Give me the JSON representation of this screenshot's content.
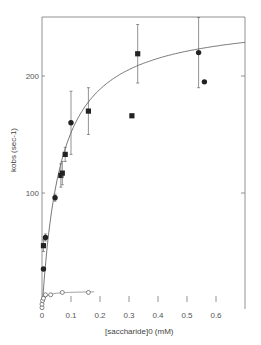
{
  "chart_data": {
    "type": "scatter",
    "title": "",
    "xlabel": "[saccharide]0 (mM)",
    "ylabel": "kobs (sec-1)",
    "xlim": [
      0,
      0.7
    ],
    "ylim": [
      0,
      250
    ],
    "x_ticks": [
      "0",
      "0.1",
      "0.2",
      "0.3",
      "0.4",
      "0.5",
      "0.6"
    ],
    "y_ticks": [
      "100",
      "200"
    ],
    "grid": false,
    "series": [
      {
        "name": "filled squares",
        "marker": "square-filled",
        "points": [
          {
            "x": 0.005,
            "y": 55,
            "err": 5
          },
          {
            "x": 0.065,
            "y": 115,
            "err": 10
          },
          {
            "x": 0.07,
            "y": 117,
            "err": 10
          },
          {
            "x": 0.08,
            "y": 133,
            "err": 6
          },
          {
            "x": 0.16,
            "y": 170,
            "err": 20
          },
          {
            "x": 0.31,
            "y": 166
          },
          {
            "x": 0.33,
            "y": 219,
            "err": 25
          }
        ]
      },
      {
        "name": "filled circles",
        "marker": "circle-filled",
        "points": [
          {
            "x": 0.005,
            "y": 35
          },
          {
            "x": 0.012,
            "y": 62,
            "err": 3
          },
          {
            "x": 0.045,
            "y": 96,
            "err": 3
          },
          {
            "x": 0.1,
            "y": 160,
            "err": 27
          },
          {
            "x": 0.54,
            "y": 220,
            "err": 30
          },
          {
            "x": 0.56,
            "y": 195
          }
        ]
      },
      {
        "name": "open circles",
        "marker": "circle-open",
        "points": [
          {
            "x": 0.0,
            "y": 2
          },
          {
            "x": 0.0,
            "y": 5
          },
          {
            "x": 0.002,
            "y": 8
          },
          {
            "x": 0.005,
            "y": 10
          },
          {
            "x": 0.012,
            "y": 13
          },
          {
            "x": 0.03,
            "y": 13
          },
          {
            "x": 0.07,
            "y": 15
          },
          {
            "x": 0.16,
            "y": 15
          }
        ]
      }
    ],
    "fit_curves": [
      {
        "name": "upper saturation fit",
        "vmax": 250,
        "km": 0.065
      },
      {
        "name": "lower saturation fit",
        "plateau": 16
      }
    ]
  }
}
